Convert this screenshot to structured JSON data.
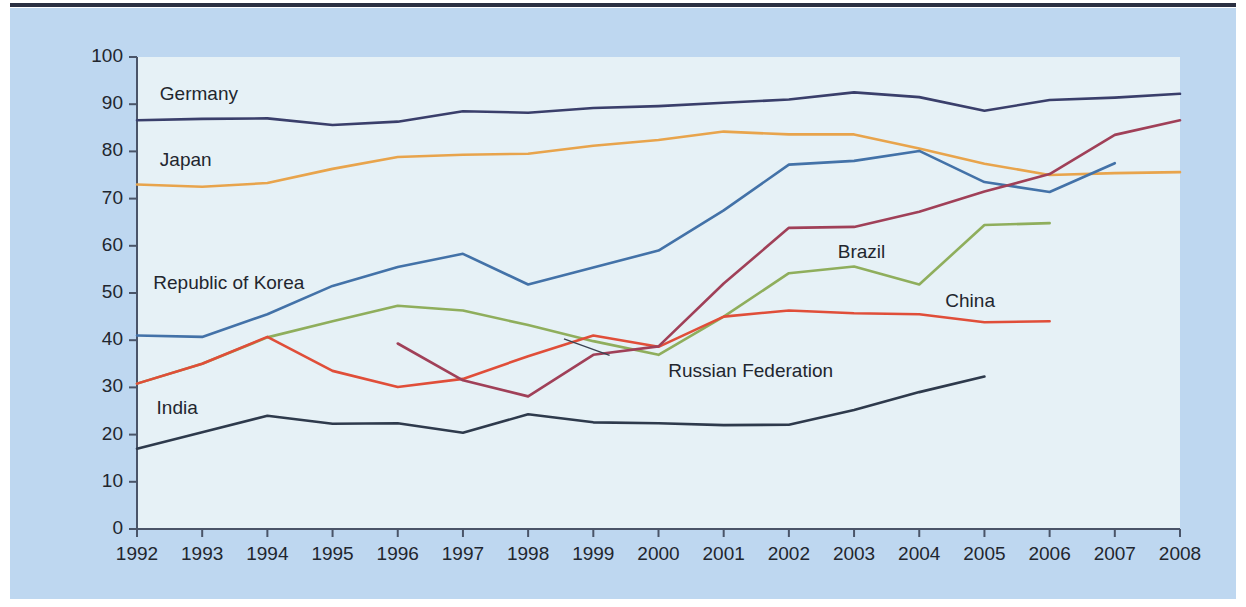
{
  "figure": {
    "background_outer": "#bed7f0",
    "background_plot": "#e6f1f6",
    "rule_color": "#2b3042"
  },
  "chart_data": {
    "type": "line",
    "title": "",
    "subtitle": "",
    "xlabel": "",
    "ylabel": "",
    "grid": false,
    "legend_position": "inline-labels",
    "x": [
      1992,
      1993,
      1994,
      1995,
      1996,
      1997,
      1998,
      1999,
      2000,
      2001,
      2002,
      2003,
      2004,
      2005,
      2006,
      2007,
      2008
    ],
    "xticklabels": [
      "1992",
      "1993",
      "1994",
      "1995",
      "1996",
      "1997",
      "1998",
      "1999",
      "2000",
      "2001",
      "2002",
      "2003",
      "2004",
      "2005",
      "2006",
      "2007",
      "2008"
    ],
    "ylim": [
      0,
      100
    ],
    "yticks": [
      0,
      10,
      20,
      30,
      40,
      50,
      60,
      70,
      80,
      90,
      100
    ],
    "yticklabels": [
      "0",
      "10",
      "20",
      "30",
      "40",
      "50",
      "60",
      "70",
      "80",
      "90",
      "100"
    ],
    "series": [
      {
        "name": "Germany",
        "color": "#3a3f6b",
        "label_x": 1992.35,
        "label_y": 92.0,
        "x": [
          1992,
          1993,
          1994,
          1995,
          1996,
          1997,
          1998,
          1999,
          2000,
          2001,
          2002,
          2003,
          2004,
          2005,
          2006,
          2007,
          2008
        ],
        "values": [
          86.6,
          86.9,
          87.0,
          85.6,
          86.3,
          88.5,
          88.2,
          89.2,
          89.6,
          90.3,
          91.0,
          92.5,
          91.5,
          88.6,
          90.9,
          91.4,
          92.2
        ]
      },
      {
        "name": "Japan",
        "color": "#e8a44c",
        "label_x": 1992.35,
        "label_y": 78.0,
        "x": [
          1992,
          1993,
          1994,
          1995,
          1996,
          1997,
          1998,
          1999,
          2000,
          2001,
          2002,
          2003,
          2004,
          2005,
          2006,
          2007,
          2008
        ],
        "values": [
          73.0,
          72.5,
          73.3,
          76.3,
          78.8,
          79.3,
          79.5,
          81.2,
          82.4,
          84.2,
          83.6,
          83.6,
          80.6,
          77.4,
          75.0,
          75.4,
          75.6
        ]
      },
      {
        "name": "Republic of Korea",
        "color": "#4372a8",
        "label_x": 1992.25,
        "label_y": 52.0,
        "x": [
          1992,
          1993,
          1994,
          1995,
          1996,
          1997,
          1998,
          1999,
          2000,
          2001,
          2002,
          2003,
          2004,
          2005,
          2006,
          2007
        ],
        "values": [
          41.0,
          40.7,
          45.5,
          51.5,
          55.5,
          58.3,
          51.8,
          55.4,
          59.0,
          67.5,
          77.2,
          78.0,
          80.1,
          73.5,
          71.4,
          77.5
        ]
      },
      {
        "name": "Brazil",
        "color": "#8fae5c",
        "label_x": 2002.75,
        "label_y": 58.5,
        "x": [
          1992,
          1993,
          1994,
          1995,
          1996,
          1997,
          1998,
          1999,
          2000,
          2001,
          2002,
          2003,
          2004,
          2005,
          2006
        ],
        "values": [
          30.8,
          35.0,
          40.6,
          44.0,
          47.3,
          46.3,
          43.2,
          39.8,
          36.9,
          45.0,
          54.2,
          55.6,
          51.8,
          64.4,
          64.8
        ]
      },
      {
        "name": "China",
        "color": "#e04e39",
        "label_x": 2004.4,
        "label_y": 48.0,
        "x": [
          1992,
          1993,
          1994,
          1995,
          1996,
          1997,
          1998,
          1999,
          2000,
          2001,
          2002,
          2003,
          2004,
          2005,
          2006
        ],
        "values": [
          30.8,
          35.0,
          40.7,
          33.5,
          30.1,
          31.8,
          36.6,
          41.0,
          38.6,
          45.0,
          46.3,
          45.7,
          45.5,
          43.8,
          44.0
        ]
      },
      {
        "name": "Russian Federation",
        "color": "#a04058",
        "label_x": 2000.15,
        "label_y": 33.3,
        "leader": {
          "x1": 1999.25,
          "y1": 36.8,
          "x2": 1998.55,
          "y2": 40.3
        },
        "x": [
          1996,
          1997,
          1998,
          1999,
          2000,
          2001,
          2002,
          2003,
          2004,
          2005,
          2006,
          2007,
          2008
        ],
        "values": [
          39.3,
          31.5,
          28.1,
          36.9,
          38.7,
          52.0,
          63.8,
          64.0,
          67.2,
          71.5,
          75.2,
          83.5,
          86.6
        ]
      },
      {
        "name": "India",
        "color": "#2e3a4c",
        "label_x": 1992.3,
        "label_y": 25.5,
        "x": [
          1992,
          1993,
          1994,
          1995,
          1996,
          1997,
          1998,
          1999,
          2000,
          2001,
          2002,
          2003,
          2004,
          2005
        ],
        "values": [
          17.0,
          20.5,
          24.0,
          22.3,
          22.4,
          20.4,
          24.3,
          22.6,
          22.4,
          22.0,
          22.1,
          25.2,
          29.0,
          32.3
        ]
      }
    ]
  }
}
